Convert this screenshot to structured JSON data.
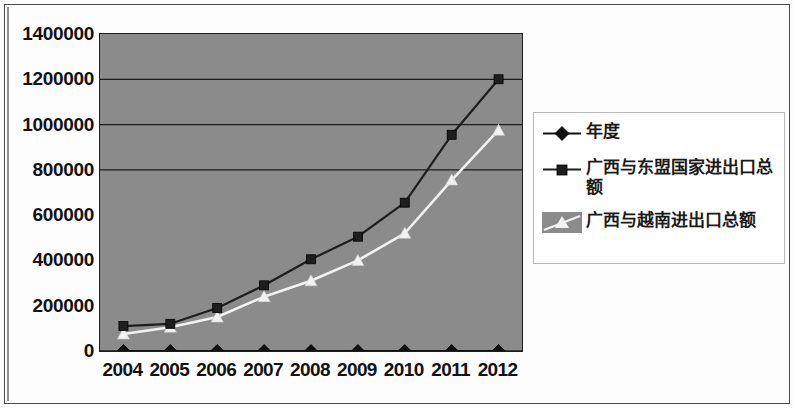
{
  "chart_data": {
    "type": "line",
    "title": "",
    "subtitle": "",
    "xlabel": "",
    "ylabel": "",
    "categories": [
      "2004",
      "2005",
      "2006",
      "2007",
      "2008",
      "2009",
      "2010",
      "2011",
      "2012"
    ],
    "ylim": [
      0,
      1400000
    ],
    "ytick_labels": [
      "1400000",
      "1200000",
      "1000000",
      "800000",
      "600000",
      "400000",
      "200000",
      "0"
    ],
    "ytick_values": [
      1400000,
      1200000,
      1000000,
      800000,
      600000,
      400000,
      200000,
      0
    ],
    "ytick_step": 200000,
    "grid": "horizontal",
    "gridline_values": [
      1200000,
      1000000,
      800000
    ],
    "legend_position": "right",
    "plot_background": "#8b8b8b",
    "series": [
      {
        "name": "年度",
        "marker": "diamond",
        "color": "#111111",
        "values": [
          0,
          0,
          0,
          0,
          0,
          0,
          0,
          0,
          0
        ]
      },
      {
        "name": "广西与东盟国家进出口总额",
        "marker": "square",
        "color": "#1e1e1e",
        "values": [
          110000,
          120000,
          190000,
          290000,
          405000,
          505000,
          655000,
          955000,
          1200000
        ]
      },
      {
        "name": "广西与越南进出口总额",
        "marker": "triangle",
        "color": "#f2f2f2",
        "values": [
          75000,
          105000,
          150000,
          240000,
          310000,
          400000,
          520000,
          755000,
          975000
        ]
      }
    ]
  },
  "legend": {
    "entries": [
      {
        "label": "年度",
        "key": "line-diamond"
      },
      {
        "label": "广西与东盟国家进出口总额",
        "key": "line-square"
      },
      {
        "label": "广西与越南进出口总额",
        "key": "swatch-triangle"
      }
    ]
  },
  "colors": {
    "plot_fill": "#8b8b8b",
    "axis": "#1c1c1c",
    "series_dark": "#1e1e1e",
    "series_light": "#f2f2f2",
    "legend_border": "#b9b9b9",
    "page_border": "#4a4a4a"
  }
}
